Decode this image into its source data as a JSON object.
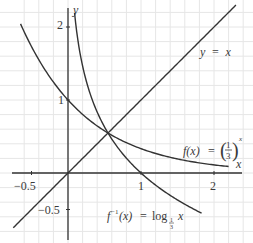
{
  "chart_data": {
    "type": "line",
    "title": "",
    "xlabel": "x",
    "ylabel": "y",
    "xlim": [
      -0.75,
      2.4
    ],
    "ylim": [
      -0.95,
      2.3
    ],
    "grid": true,
    "grid_step": 0.2,
    "x_ticks": [
      {
        "value": -0.5,
        "label": "−0.5"
      },
      {
        "value": 1,
        "label": "1"
      },
      {
        "value": 2,
        "label": "2"
      }
    ],
    "y_ticks": [
      {
        "value": -0.5,
        "label": "−0.5"
      },
      {
        "value": 1,
        "label": "1"
      },
      {
        "value": 2,
        "label": "2"
      }
    ],
    "series": [
      {
        "name": "y = x",
        "kind": "identity",
        "domain": [
          -0.75,
          2.3
        ],
        "points": [
          [
            -0.75,
            -0.75
          ],
          [
            0,
            0
          ],
          [
            0.55,
            0.55
          ],
          [
            1,
            1
          ],
          [
            2,
            2
          ],
          [
            2.3,
            2.3
          ]
        ]
      },
      {
        "name": "f(x) = (1/3)^x",
        "kind": "exp",
        "base": 0.3333,
        "domain": [
          -0.65,
          2.2
        ],
        "points": [
          [
            -0.65,
            2.04
          ],
          [
            -0.5,
            1.73
          ],
          [
            0,
            1
          ],
          [
            0.55,
            0.55
          ],
          [
            1,
            0.333
          ],
          [
            1.5,
            0.192
          ],
          [
            2,
            0.111
          ],
          [
            2.2,
            0.089
          ]
        ]
      },
      {
        "name": "f⁻¹(x) = log_{1/3} x",
        "kind": "log",
        "base": 0.3333,
        "domain": [
          0.09,
          1.83
        ],
        "points": [
          [
            0.089,
            2.2
          ],
          [
            0.111,
            2.0
          ],
          [
            0.2,
            1.46
          ],
          [
            0.333,
            1.0
          ],
          [
            0.55,
            0.55
          ],
          [
            1,
            0
          ],
          [
            1.5,
            -0.37
          ],
          [
            1.83,
            -0.55
          ]
        ]
      }
    ],
    "annotations": [
      {
        "text": "y = x",
        "x": 1.9,
        "y": 1.45
      },
      {
        "text": "f(x) = (1/3)^x",
        "x": 1.48,
        "y": 0.45
      },
      {
        "text": "f⁻¹(x) = log_{1/3} x",
        "x": 0.66,
        "y": -0.7
      },
      {
        "text": "intersection",
        "x": 0.55,
        "y": 0.55
      }
    ],
    "legend": "none"
  },
  "labels": {
    "x_axis": "x",
    "y_axis": "y",
    "tick_x_neg": "−0.5",
    "tick_x_1": "1",
    "tick_x_2": "2",
    "tick_y_neg": "−0.5",
    "tick_y_1": "1",
    "tick_y_2": "2",
    "line_identity": "y  =  x",
    "exp_fx": "f(x)",
    "exp_eq": "=",
    "exp_num": "1",
    "exp_den": "3",
    "exp_pow": "x",
    "log_f": "f",
    "log_sup": "−1",
    "log_x": "(x)",
    "log_eq": "=",
    "log_word": "log",
    "log_sub": "1",
    "log_sub_den": "3",
    "log_arg": "x"
  },
  "style": {
    "axis_color": "#333333",
    "curve_color": "#333333",
    "grid_color": "#e6e6e6"
  }
}
